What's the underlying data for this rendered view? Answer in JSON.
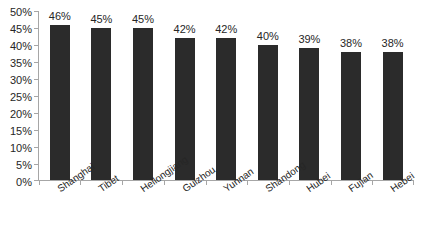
{
  "chart_data": {
    "type": "bar",
    "title": "",
    "subtitle": "",
    "xlabel": "",
    "ylabel": "",
    "ylim": [
      0,
      50
    ],
    "y_unit": "%",
    "grid": false,
    "legend": false,
    "legend_position": "none",
    "bar_color": "#2b2b2b",
    "axis_color": "#a6a6a6",
    "text_color": "#262626",
    "categories": [
      "Shanghai",
      "Tibet",
      "Heilongjiang",
      "Guizhou",
      "Yunnan",
      "Shandong",
      "Hubei",
      "Fujian",
      "Hebei"
    ],
    "values": [
      46,
      45,
      45,
      42,
      42,
      40,
      39,
      38,
      38
    ],
    "data_labels": [
      "46%",
      "45%",
      "45%",
      "42%",
      "42%",
      "40%",
      "39%",
      "38%",
      "38%"
    ],
    "y_ticks": [
      0,
      5,
      10,
      15,
      20,
      25,
      30,
      35,
      40,
      45,
      50
    ],
    "y_tick_labels": [
      "50%",
      "45%",
      "40%",
      "35%",
      "30%",
      "25%",
      "20%",
      "15%",
      "10%",
      "5%",
      "0%"
    ]
  }
}
